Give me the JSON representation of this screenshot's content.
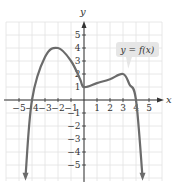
{
  "chart_data": {
    "type": "line",
    "title": "",
    "xlabel": "x",
    "ylabel": "y",
    "xlim": [
      -6,
      6
    ],
    "ylim": [
      -6,
      6
    ],
    "grid": true,
    "x_ticks": [
      -5,
      -4,
      -3,
      -2,
      -1,
      1,
      2,
      3,
      4,
      5
    ],
    "y_ticks": [
      -5,
      -4,
      -3,
      -2,
      -1,
      1,
      2,
      3,
      4,
      5
    ],
    "x_tick_labels": [
      "−5",
      "−4",
      "−3",
      "−2",
      "−1",
      "1",
      "2",
      "3",
      "4",
      "5"
    ],
    "y_tick_labels": [
      "−5",
      "−4",
      "−3",
      "−2",
      "−1",
      "1",
      "2",
      "3",
      "4",
      "5"
    ],
    "series": [
      {
        "name": "y = f(x)",
        "points": [
          [
            -4.5,
            -5.9
          ],
          [
            -4,
            0
          ],
          [
            -3,
            3.3
          ],
          [
            -2,
            4
          ],
          [
            -1,
            3
          ],
          [
            -0.3,
            1.6
          ],
          [
            0,
            1
          ],
          [
            1,
            1.3
          ],
          [
            2,
            1.6
          ],
          [
            3,
            2
          ],
          [
            3.5,
            1.2
          ],
          [
            4,
            0
          ],
          [
            4.5,
            -5.9
          ]
        ],
        "end_arrows": true
      }
    ],
    "annotations": [
      {
        "text": "y = f(x)",
        "x": 3.3,
        "y": 3.9,
        "points_to": [
          3.4,
          2.4
        ]
      }
    ],
    "colors": {
      "curve": "#6b6b6b",
      "grid": "#e2e2e2",
      "axis": "#333333",
      "callout_bg": "#e6e6e6"
    }
  },
  "labels": {
    "x_axis": "x",
    "y_axis": "y",
    "callout": "y = f(x)"
  }
}
